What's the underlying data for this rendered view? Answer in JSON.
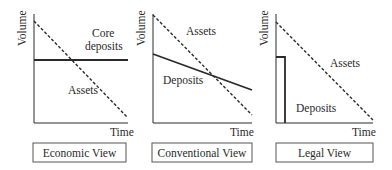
{
  "panels": [
    {
      "title": "Economic View",
      "y_axis_label": "Volume",
      "x_axis_label": "Time",
      "labels": {
        "upper": [
          "Core",
          "deposits"
        ],
        "lower": "Assets"
      },
      "series": [
        {
          "name": "Assets",
          "style": "dashed",
          "from": [
            0,
            1.0
          ],
          "to": [
            1.0,
            0.0
          ]
        },
        {
          "name": "Core deposits",
          "style": "solid",
          "from": [
            0,
            0.6
          ],
          "to": [
            1.0,
            0.6
          ]
        }
      ]
    },
    {
      "title": "Conventional View",
      "y_axis_label": "Volume",
      "x_axis_label": "Time",
      "labels": {
        "upper": "Assets",
        "lower": "Deposits"
      },
      "series": [
        {
          "name": "Assets",
          "style": "dashed",
          "from": [
            0,
            1.0
          ],
          "to": [
            1.0,
            0.08
          ]
        },
        {
          "name": "Deposits",
          "style": "solid",
          "from": [
            0,
            0.64
          ],
          "to": [
            1.0,
            0.31
          ]
        }
      ]
    },
    {
      "title": "Legal View",
      "y_axis_label": "Volume",
      "x_axis_label": "Time",
      "labels": {
        "upper": "Assets",
        "lower": "Deposits"
      },
      "series": [
        {
          "name": "Assets",
          "style": "dashed",
          "from": [
            0,
            0.93
          ],
          "to": [
            1.0,
            0.03
          ]
        },
        {
          "name": "Deposits",
          "style": "solid-step",
          "height": 0.6,
          "width": 0.09
        }
      ]
    }
  ],
  "colors": {
    "line": "#2a2a2a",
    "background": "#ffffff"
  }
}
